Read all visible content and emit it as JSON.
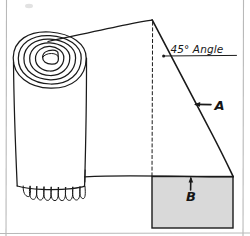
{
  "figure": {
    "title_visible": false,
    "background_color": "#ffffff",
    "ink_color": "#1a1a1a",
    "frame_color": "#b9b9b9",
    "shaded_region_fill": "#d9d9d9"
  },
  "annotations": {
    "angle_label": "45° Angle",
    "callout_a": "A",
    "callout_b": "B"
  },
  "geometry": {
    "roll_top_ellipse_center_x": 50,
    "roll_top_ellipse_center_y": 60,
    "spiral_turns": 6,
    "fringe_loops": 9,
    "top_corner_x": 152,
    "top_corner_y": 20,
    "baseline_y": 176,
    "diagonal_end_x": 233,
    "shaded_rect_left": 152,
    "shaded_rect_top": 176,
    "shaded_rect_right": 233,
    "shaded_rect_bottom": 228
  },
  "colors": {
    "ink": "#1a1a1a",
    "shade": "#d9d9d9",
    "frame": "#b9b9b9",
    "paper": "#ffffff"
  }
}
